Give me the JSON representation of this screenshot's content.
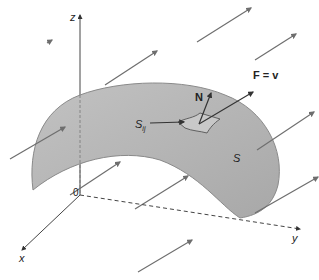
{
  "diagram": {
    "axes": {
      "z_label": "z",
      "x_label": "x",
      "y_label": "y",
      "origin_label": "0"
    },
    "labels": {
      "normal": "N",
      "field": "F = v",
      "surface": "S",
      "patch_main": "S",
      "patch_sub": "ij"
    },
    "colors": {
      "surface_fill": "#b4b4b4",
      "surface_edge": "#8a8a8a",
      "arrow": "#6e6e6e",
      "axis": "#444444",
      "text": "#222222"
    }
  }
}
